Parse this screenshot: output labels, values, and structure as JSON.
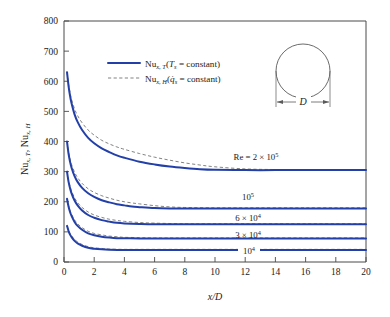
{
  "chart_data": {
    "type": "line",
    "title": "",
    "xlabel": "x/D",
    "ylabel": "Nu_{x,T}, Nu_{x,H}",
    "xlim": [
      0,
      20
    ],
    "ylim": [
      0,
      800
    ],
    "xticks": [
      0,
      2,
      4,
      6,
      8,
      10,
      12,
      14,
      16,
      18,
      20
    ],
    "yticks": [
      0,
      100,
      200,
      300,
      400,
      500,
      600,
      700,
      800
    ],
    "grid": false,
    "legend_position": "upper-center-left",
    "legend": [
      {
        "key": "Nu_x,T",
        "style": "solid",
        "color": "#2340a8",
        "condition": "T_s = constant"
      },
      {
        "key": "Nu_x,H",
        "style": "dashed",
        "color": "#6b6b6b",
        "condition": "q̇_s = constant"
      }
    ],
    "annotations": [
      {
        "text": "Re = 2 × 10⁵",
        "x": 12.2,
        "y": 340
      },
      {
        "text": "10⁵",
        "x": 11.6,
        "y": 212
      },
      {
        "text": "6 × 10⁴",
        "x": 11.6,
        "y": 150
      },
      {
        "text": "3 × 10⁴",
        "x": 11.6,
        "y": 103
      },
      {
        "text": "10⁴",
        "x": 11.6,
        "y": 58
      }
    ],
    "inset": {
      "shape": "circle",
      "dimension_label": "D"
    },
    "series": [
      {
        "name": "Re = 2 × 10⁵ (T_s = constant)",
        "style": "solid",
        "re": 200000,
        "asymptote": 305,
        "start_value": 630,
        "x": [
          0.2,
          0.3,
          0.4,
          0.5,
          0.7,
          0.9,
          1.2,
          1.6,
          2.0,
          2.5,
          3.0,
          3.5,
          4.0,
          5.0,
          6.0,
          7.0,
          8.0,
          9.0,
          10.0,
          12.0,
          14.0,
          16.0,
          18.0,
          20.0
        ],
        "y": [
          630,
          585,
          552,
          527,
          490,
          465,
          438,
          412,
          394,
          377,
          365,
          354,
          346,
          333,
          324,
          317,
          312,
          308,
          306,
          305,
          305,
          305,
          305,
          305
        ]
      },
      {
        "name": "Re = 2 × 10⁵ (q_s = constant)",
        "style": "dashed",
        "re": 200000,
        "asymptote": 307,
        "start_value": 630,
        "x": [
          0.2,
          0.3,
          0.4,
          0.5,
          0.7,
          0.9,
          1.2,
          1.6,
          2.0,
          2.5,
          3.0,
          3.5,
          4.0,
          5.0,
          6.0,
          7.0,
          8.0,
          9.0,
          10.0,
          12.0,
          14.0,
          16.0,
          18.0,
          20.0
        ],
        "y": [
          630,
          592,
          562,
          540,
          508,
          486,
          462,
          438,
          421,
          404,
          392,
          382,
          374,
          360,
          348,
          338,
          329,
          322,
          316,
          309,
          307,
          307,
          307,
          307
        ]
      },
      {
        "name": "Re = 10⁵ (T_s = constant)",
        "style": "solid",
        "re": 100000,
        "asymptote": 178,
        "start_value": 400,
        "x": [
          0.2,
          0.3,
          0.4,
          0.5,
          0.7,
          0.9,
          1.2,
          1.6,
          2.0,
          2.5,
          3.0,
          3.5,
          4.0,
          4.5,
          5.0,
          6.0,
          7.0,
          8.0,
          10.0,
          12.0,
          16.0,
          20.0
        ],
        "y": [
          400,
          360,
          333,
          313,
          285,
          266,
          246,
          228,
          216,
          205,
          198,
          192,
          188,
          184,
          182,
          179,
          178,
          178,
          178,
          178,
          178,
          178
        ]
      },
      {
        "name": "Re = 10⁵ (q_s = constant)",
        "style": "dashed",
        "re": 100000,
        "asymptote": 180,
        "start_value": 400,
        "x": [
          0.2,
          0.3,
          0.4,
          0.5,
          0.7,
          0.9,
          1.2,
          1.6,
          2.0,
          2.5,
          3.0,
          3.5,
          4.0,
          4.5,
          5.0,
          6.0,
          7.0,
          8.0,
          10.0,
          12.0,
          16.0,
          20.0
        ],
        "y": [
          400,
          366,
          342,
          324,
          298,
          280,
          261,
          243,
          231,
          220,
          212,
          205,
          200,
          196,
          193,
          187,
          183,
          181,
          180,
          180,
          180,
          180
        ]
      },
      {
        "name": "Re = 6 × 10⁴ (T_s = constant)",
        "style": "solid",
        "re": 60000,
        "asymptote": 125,
        "start_value": 300,
        "x": [
          0.2,
          0.3,
          0.4,
          0.5,
          0.7,
          0.9,
          1.2,
          1.6,
          2.0,
          2.5,
          3.0,
          3.5,
          4.0,
          5.0,
          6.0,
          8.0,
          10.0,
          14.0,
          20.0
        ],
        "y": [
          300,
          267,
          245,
          228,
          204,
          188,
          171,
          156,
          147,
          139,
          134,
          130,
          128,
          126,
          125,
          125,
          125,
          125,
          125
        ]
      },
      {
        "name": "Re = 6 × 10⁴ (q_s = constant)",
        "style": "dashed",
        "re": 60000,
        "asymptote": 127,
        "start_value": 300,
        "x": [
          0.2,
          0.3,
          0.4,
          0.5,
          0.7,
          0.9,
          1.2,
          1.6,
          2.0,
          2.5,
          3.0,
          3.5,
          4.0,
          5.0,
          6.0,
          8.0,
          10.0,
          14.0,
          20.0
        ],
        "y": [
          300,
          272,
          252,
          236,
          213,
          197,
          181,
          166,
          156,
          148,
          142,
          138,
          135,
          131,
          129,
          127,
          127,
          127,
          127
        ]
      },
      {
        "name": "Re = 3 × 10⁴ (T_s = constant)",
        "style": "solid",
        "re": 30000,
        "asymptote": 78,
        "start_value": 210,
        "x": [
          0.2,
          0.3,
          0.4,
          0.5,
          0.7,
          0.9,
          1.2,
          1.6,
          2.0,
          2.5,
          3.0,
          3.5,
          4.0,
          5.0,
          6.0,
          8.0,
          12.0,
          20.0
        ],
        "y": [
          210,
          184,
          166,
          153,
          133,
          120,
          107,
          95,
          89,
          84,
          81,
          79,
          79,
          78,
          78,
          78,
          78,
          78
        ]
      },
      {
        "name": "Re = 3 × 10⁴ (q_s = constant)",
        "style": "dashed",
        "re": 30000,
        "asymptote": 80,
        "start_value": 210,
        "x": [
          0.2,
          0.3,
          0.4,
          0.5,
          0.7,
          0.9,
          1.2,
          1.6,
          2.0,
          2.5,
          3.0,
          3.5,
          4.0,
          5.0,
          6.0,
          8.0,
          12.0,
          20.0
        ],
        "y": [
          210,
          188,
          172,
          159,
          140,
          127,
          114,
          102,
          95,
          90,
          86,
          84,
          82,
          81,
          80,
          80,
          80,
          80
        ]
      },
      {
        "name": "Re = 10⁴ (T_s = constant)",
        "style": "solid",
        "re": 10000,
        "asymptote": 40,
        "start_value": 120,
        "x": [
          0.2,
          0.3,
          0.4,
          0.5,
          0.7,
          0.9,
          1.2,
          1.6,
          2.0,
          2.5,
          3.0,
          4.0,
          5.0,
          8.0,
          12.0,
          20.0
        ],
        "y": [
          120,
          103,
          91,
          83,
          70,
          62,
          54,
          47,
          44,
          42,
          41,
          40,
          40,
          40,
          40,
          40
        ]
      },
      {
        "name": "Re = 10⁴ (q_s = constant)",
        "style": "dashed",
        "re": 10000,
        "asymptote": 42,
        "start_value": 120,
        "x": [
          0.2,
          0.3,
          0.4,
          0.5,
          0.7,
          0.9,
          1.2,
          1.6,
          2.0,
          2.5,
          3.0,
          4.0,
          5.0,
          8.0,
          12.0,
          20.0
        ],
        "y": [
          120,
          106,
          95,
          87,
          75,
          67,
          58,
          51,
          47,
          45,
          43,
          42,
          42,
          42,
          42,
          42
        ]
      }
    ]
  },
  "axes": {
    "x_title_text": "x/D",
    "y_title_parts": {
      "nu": "Nu",
      "sub1": "x, T",
      "comma": ", ",
      "nu2": "Nu",
      "sub2": "x, H"
    },
    "xtick_labels": [
      "0",
      "2",
      "4",
      "6",
      "8",
      "10",
      "12",
      "14",
      "16",
      "18",
      "20"
    ],
    "ytick_labels": [
      "0",
      "100",
      "200",
      "300",
      "400",
      "500",
      "600",
      "700",
      "800"
    ]
  },
  "legend": {
    "entry1": {
      "nu": "Nu",
      "sub": "x, T",
      "paren_open": "(",
      "var": "T",
      "varsub": "s",
      "eq": " = constant",
      "paren_close": ")"
    },
    "entry2": {
      "nu": "Nu",
      "sub": "x, H",
      "paren_open": "(",
      "var": "q̇",
      "varsub": "s",
      "eq": " = constant",
      "paren_close": ")"
    }
  },
  "inset": {
    "dimension_label": "D"
  },
  "curve_labels": {
    "re1": {
      "prefix": "Re = 2 ",
      "times": "×",
      "base": " 10",
      "exp": "5"
    },
    "re2": {
      "base": "10",
      "exp": "5"
    },
    "re3": {
      "prefix": "6 ",
      "times": "×",
      "base": " 10",
      "exp": "4"
    },
    "re4": {
      "prefix": "3 ",
      "times": "×",
      "base": " 10",
      "exp": "4"
    },
    "re5": {
      "base": "10",
      "exp": "4"
    }
  },
  "colors": {
    "curve_t": "#2340a8",
    "curve_h": "#6b6b6b",
    "axis": "#4a4a4a",
    "text": "#1a1a1a",
    "background": "#ffffff"
  }
}
